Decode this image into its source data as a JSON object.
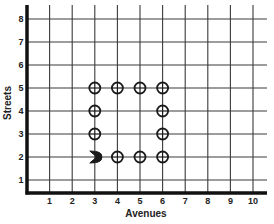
{
  "chart_data": {
    "type": "scatter",
    "title": "",
    "xlabel": "Avenues",
    "ylabel": "Streets",
    "xlim": [
      0,
      10.6
    ],
    "ylim": [
      0,
      8.6
    ],
    "grid": true,
    "x_ticks": [
      "1",
      "2",
      "3",
      "4",
      "5",
      "6",
      "7",
      "8",
      "9",
      "10"
    ],
    "y_ticks": [
      "1",
      "2",
      "3",
      "4",
      "5",
      "6",
      "7",
      "8"
    ],
    "series": [
      {
        "name": "circle-markers",
        "marker": "circle-cross",
        "points": [
          {
            "x": 3,
            "y": 5
          },
          {
            "x": 4,
            "y": 5
          },
          {
            "x": 5,
            "y": 5
          },
          {
            "x": 6,
            "y": 5
          },
          {
            "x": 3,
            "y": 4
          },
          {
            "x": 6,
            "y": 4
          },
          {
            "x": 3,
            "y": 3
          },
          {
            "x": 6,
            "y": 3
          },
          {
            "x": 4,
            "y": 2
          },
          {
            "x": 5,
            "y": 2
          },
          {
            "x": 6,
            "y": 2
          }
        ]
      },
      {
        "name": "start-marker",
        "marker": "arrowhead-right",
        "points": [
          {
            "x": 3,
            "y": 2
          }
        ]
      }
    ],
    "colors": {
      "grid": "#3a3a3a",
      "axis": "#111111",
      "marker": "#1a1a1a"
    }
  }
}
